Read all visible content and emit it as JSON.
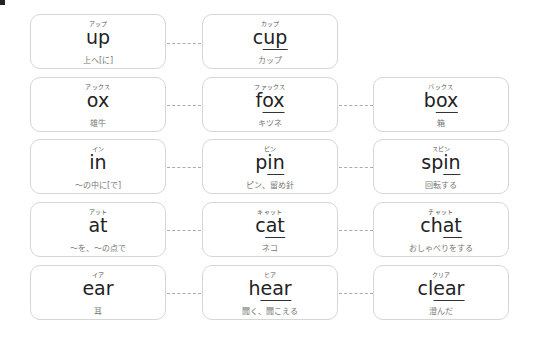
{
  "rows": [
    {
      "cards": [
        {
          "kana": "アップ",
          "pre": "",
          "ul": "",
          "post": "up",
          "meaning": "上へ[に]"
        },
        {
          "kana": "カップ",
          "pre": "c",
          "ul": "up",
          "post": "",
          "meaning": "カップ"
        }
      ]
    },
    {
      "cards": [
        {
          "kana": "アックス",
          "pre": "",
          "ul": "",
          "post": "ox",
          "meaning": "雄牛"
        },
        {
          "kana": "ファックス",
          "pre": "f",
          "ul": "ox",
          "post": "",
          "meaning": "キツネ"
        },
        {
          "kana": "バックス",
          "pre": "b",
          "ul": "ox",
          "post": "",
          "meaning": "箱"
        }
      ]
    },
    {
      "cards": [
        {
          "kana": "イン",
          "pre": "",
          "ul": "",
          "post": "in",
          "meaning": "～の中に[で]"
        },
        {
          "kana": "ピン",
          "pre": "p",
          "ul": "in",
          "post": "",
          "meaning": "ピン、留め針"
        },
        {
          "kana": "スピン",
          "pre": "sp",
          "ul": "in",
          "post": "",
          "meaning": "回転する"
        }
      ]
    },
    {
      "cards": [
        {
          "kana": "アット",
          "pre": "",
          "ul": "",
          "post": "at",
          "meaning": "～を、～の点で"
        },
        {
          "kana": "キャット",
          "pre": "c",
          "ul": "at",
          "post": "",
          "meaning": "ネコ"
        },
        {
          "kana": "チャット",
          "pre": "ch",
          "ul": "at",
          "post": "",
          "meaning": "おしゃべりをする"
        }
      ]
    },
    {
      "cards": [
        {
          "kana": "イア",
          "pre": "",
          "ul": "",
          "post": "ear",
          "meaning": "耳"
        },
        {
          "kana": "ヒア",
          "pre": "h",
          "ul": "ear",
          "post": "",
          "meaning": "聞く、聞こえる"
        },
        {
          "kana": "クリア",
          "pre": "cl",
          "ul": "ear",
          "post": "",
          "meaning": "澄んだ"
        }
      ]
    }
  ]
}
